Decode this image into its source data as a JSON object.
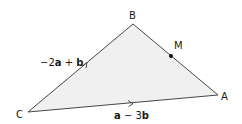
{
  "diagram": {
    "type": "triangle",
    "fill_color": "#f0f0f0",
    "stroke_color": "#333333",
    "vertices": {
      "B": {
        "label": "B",
        "x": 133,
        "y": 24
      },
      "C": {
        "label": "C",
        "x": 28,
        "y": 112
      },
      "A": {
        "label": "A",
        "x": 218,
        "y": 95
      }
    },
    "point_M": {
      "label": "M",
      "x": 171,
      "y": 56,
      "on_side": "BA"
    },
    "vectors": {
      "CB": {
        "prefix": "−2",
        "a": "a",
        "middle": " + ",
        "b": "b",
        "full": "−2a + b"
      },
      "CA": {
        "a": "a",
        "middle": " − 3",
        "b": "b",
        "full": "a − 3b"
      }
    }
  }
}
